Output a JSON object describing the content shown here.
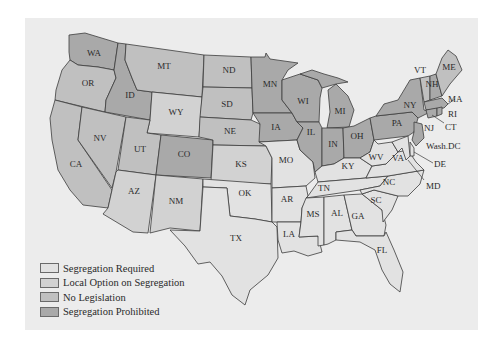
{
  "legend": {
    "items": [
      {
        "key": "required",
        "label": "Segregation Required",
        "color": "#e2e2e2"
      },
      {
        "key": "local",
        "label": "Local Option on Segregation",
        "color": "#d2d2d2"
      },
      {
        "key": "none",
        "label": "No Legislation",
        "color": "#c0c0c0"
      },
      {
        "key": "prohibited",
        "label": "Segregation Prohibited",
        "color": "#a9a9a9"
      }
    ]
  },
  "states": {
    "WA": {
      "label": "WA",
      "category": "prohibited"
    },
    "OR": {
      "label": "OR",
      "category": "none"
    },
    "CA": {
      "label": "CA",
      "category": "none"
    },
    "ID": {
      "label": "ID",
      "category": "prohibited"
    },
    "NV": {
      "label": "NV",
      "category": "none"
    },
    "MT": {
      "label": "MT",
      "category": "none"
    },
    "WY": {
      "label": "WY",
      "category": "local"
    },
    "UT": {
      "label": "UT",
      "category": "none"
    },
    "AZ": {
      "label": "AZ",
      "category": "local"
    },
    "CO": {
      "label": "CO",
      "category": "prohibited"
    },
    "NM": {
      "label": "NM",
      "category": "local"
    },
    "ND": {
      "label": "ND",
      "category": "none"
    },
    "SD": {
      "label": "SD",
      "category": "none"
    },
    "NE": {
      "label": "NE",
      "category": "none"
    },
    "KS": {
      "label": "KS",
      "category": "local"
    },
    "OK": {
      "label": "OK",
      "category": "required"
    },
    "TX": {
      "label": "TX",
      "category": "required"
    },
    "MN": {
      "label": "MN",
      "category": "prohibited"
    },
    "IA": {
      "label": "IA",
      "category": "prohibited"
    },
    "MO": {
      "label": "MO",
      "category": "required"
    },
    "AR": {
      "label": "AR",
      "category": "required"
    },
    "LA": {
      "label": "LA",
      "category": "required"
    },
    "WI": {
      "label": "WI",
      "category": "prohibited"
    },
    "IL": {
      "label": "IL",
      "category": "prohibited"
    },
    "MI": {
      "label": "MI",
      "category": "prohibited"
    },
    "IN": {
      "label": "IN",
      "category": "prohibited"
    },
    "OH": {
      "label": "OH",
      "category": "prohibited"
    },
    "KY": {
      "label": "KY",
      "category": "required"
    },
    "TN": {
      "label": "TN",
      "category": "required"
    },
    "MS": {
      "label": "MS",
      "category": "required"
    },
    "AL": {
      "label": "AL",
      "category": "required"
    },
    "GA": {
      "label": "GA",
      "category": "required"
    },
    "FL": {
      "label": "FL",
      "category": "required"
    },
    "SC": {
      "label": "SC",
      "category": "required"
    },
    "NC": {
      "label": "NC",
      "category": "required"
    },
    "VA": {
      "label": "VA",
      "category": "required"
    },
    "WV": {
      "label": "WV",
      "category": "required"
    },
    "PA": {
      "label": "PA",
      "category": "prohibited"
    },
    "NY": {
      "label": "NY",
      "category": "prohibited"
    },
    "NJ": {
      "label": "NJ",
      "category": "prohibited"
    },
    "VT": {
      "label": "VT",
      "category": "none"
    },
    "NH": {
      "label": "NH",
      "category": "prohibited"
    },
    "ME": {
      "label": "ME",
      "category": "none"
    },
    "MA": {
      "label": "MA",
      "category": "prohibited"
    },
    "RI": {
      "label": "RI",
      "category": "prohibited"
    },
    "CT": {
      "label": "CT",
      "category": "prohibited"
    },
    "DE": {
      "label": "DE",
      "category": "required"
    },
    "MD": {
      "label": "MD",
      "category": "required"
    },
    "DC": {
      "label": "Wash.DC",
      "category": "required"
    }
  }
}
